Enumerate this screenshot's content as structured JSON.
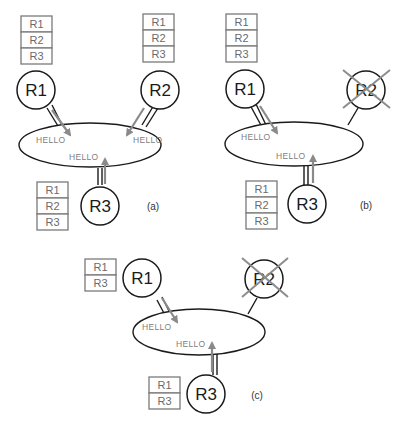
{
  "diagram": {
    "panels": [
      {
        "id": "a",
        "caption": "(a)",
        "routers": [
          {
            "name": "R1",
            "failed": false,
            "table": [
              "R1",
              "R2",
              "R3"
            ]
          },
          {
            "name": "R2",
            "failed": false,
            "table": [
              "R1",
              "R2",
              "R3"
            ]
          },
          {
            "name": "R3",
            "failed": false,
            "table": [
              "R1",
              "R2",
              "R3"
            ]
          }
        ],
        "messages": [
          "HELLO",
          "HELLO",
          "HELLO"
        ]
      },
      {
        "id": "b",
        "caption": "(b)",
        "routers": [
          {
            "name": "R1",
            "failed": false,
            "table": [
              "R1",
              "R2",
              "R3"
            ]
          },
          {
            "name": "R2",
            "failed": true,
            "table": []
          },
          {
            "name": "R3",
            "failed": false,
            "table": [
              "R1",
              "R2",
              "R3"
            ]
          }
        ],
        "messages": [
          "HELLO",
          "HELLO"
        ]
      },
      {
        "id": "c",
        "caption": "(c)",
        "routers": [
          {
            "name": "R1",
            "failed": false,
            "table": [
              "R1",
              "R3"
            ]
          },
          {
            "name": "R2",
            "failed": true,
            "table": []
          },
          {
            "name": "R3",
            "failed": false,
            "table": [
              "R1",
              "R3"
            ]
          }
        ],
        "messages": [
          "HELLO",
          "HELLO"
        ]
      }
    ]
  },
  "colors": {
    "node_stroke": "#1a1a1a",
    "table_stroke": "#7a7a7a",
    "arrow": "#8a8a8a",
    "cross": "#8c8c8c"
  }
}
